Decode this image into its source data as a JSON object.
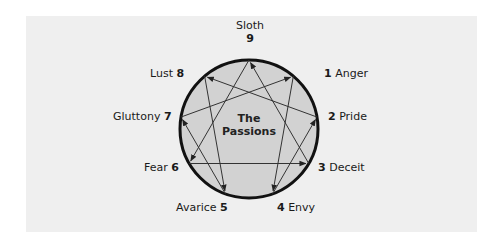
{
  "title": "The Passions",
  "title_line1": "The",
  "title_line2": "Passions",
  "colors": {
    "panel": "#efefef",
    "circle_fill": "#d2d2d2",
    "circle_stroke": "#111111",
    "line": "#333333"
  },
  "points": [
    {
      "number": "9",
      "name": "Sloth"
    },
    {
      "number": "1",
      "name": "Anger"
    },
    {
      "number": "2",
      "name": "Pride"
    },
    {
      "number": "3",
      "name": "Deceit"
    },
    {
      "number": "4",
      "name": "Envy"
    },
    {
      "number": "5",
      "name": "Avarice"
    },
    {
      "number": "6",
      "name": "Fear"
    },
    {
      "number": "7",
      "name": "Gluttony"
    },
    {
      "number": "8",
      "name": "Lust"
    }
  ],
  "arrows": [
    {
      "from": "1",
      "to": "4"
    },
    {
      "from": "4",
      "to": "2"
    },
    {
      "from": "2",
      "to": "8"
    },
    {
      "from": "8",
      "to": "5"
    },
    {
      "from": "5",
      "to": "7"
    },
    {
      "from": "7",
      "to": "1"
    },
    {
      "from": "9",
      "to": "6"
    },
    {
      "from": "6",
      "to": "3"
    },
    {
      "from": "3",
      "to": "9"
    }
  ]
}
